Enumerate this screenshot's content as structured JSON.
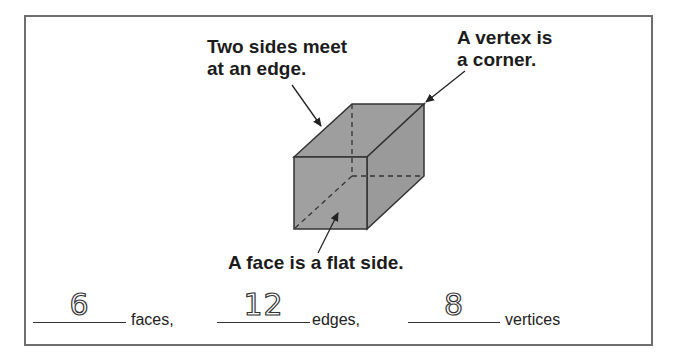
{
  "labels": {
    "edge_line1": "Two sides meet",
    "edge_line2": "at an edge.",
    "vertex_line1": "A vertex is",
    "vertex_line2": "a corner.",
    "face": "A face is a flat side."
  },
  "figure": {
    "shape": "cube",
    "face_color": "#9e9e9e",
    "edge_color": "#333333",
    "hidden_edges_style": "dashed"
  },
  "answers": [
    {
      "value": "6",
      "unit": "faces,"
    },
    {
      "value": "12",
      "unit": "edges,"
    },
    {
      "value": "8",
      "unit": "vertices"
    }
  ]
}
